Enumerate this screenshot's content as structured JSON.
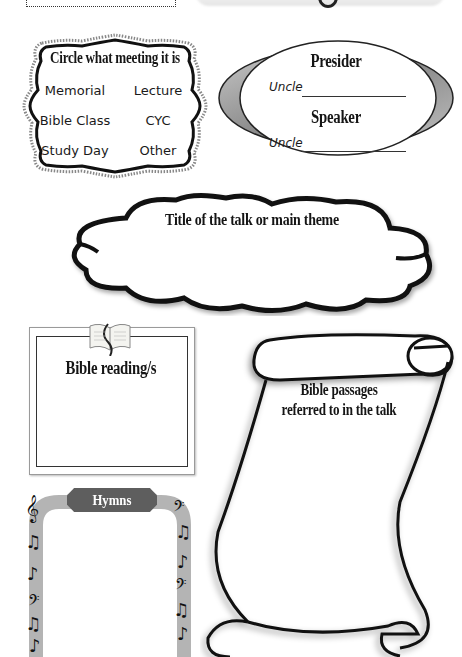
{
  "meeting_selector": {
    "title": "Circle what meeting it is",
    "options": [
      "Memorial",
      "Lecture",
      "Bible Class",
      "CYC",
      "Study Day",
      "Other"
    ]
  },
  "roles": {
    "presider": {
      "title": "Presider",
      "prefix": "Uncle",
      "value": ""
    },
    "speaker": {
      "title": "Speaker",
      "prefix": "Uncle",
      "value": ""
    }
  },
  "talk_title": {
    "label": "Title of the talk or main theme",
    "value": ""
  },
  "bible_readings": {
    "label": "Bible reading/s",
    "value": ""
  },
  "bible_passages": {
    "label_line1": "Bible passages",
    "label_line2": "referred to in the talk",
    "value": ""
  },
  "hymns": {
    "label": "Hymns",
    "value": ""
  },
  "colors": {
    "ink": "#151515",
    "banner": "#5e5e5e",
    "arch": "#b4b4b4",
    "oval_ring": "#9a9a9a"
  },
  "icons": {
    "bible": "open-book-icon",
    "notes": [
      "treble-clef",
      "bass-clef",
      "eighth-notes",
      "quarter-note"
    ]
  }
}
